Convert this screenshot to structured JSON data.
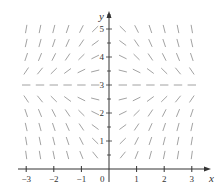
{
  "diagram": {
    "type": "slope_field",
    "axis_labels": {
      "x": "x",
      "y": "y"
    },
    "origin_label": "0",
    "x_ticks": [
      {
        "value": -3,
        "label": "−3"
      },
      {
        "value": -2,
        "label": "−2"
      },
      {
        "value": -1,
        "label": "−1"
      },
      {
        "value": 1,
        "label": "1"
      },
      {
        "value": 2,
        "label": "2"
      },
      {
        "value": 3,
        "label": "3"
      }
    ],
    "y_ticks": [
      {
        "value": 1,
        "label": "1"
      },
      {
        "value": 2,
        "label": "2"
      },
      {
        "value": 3,
        "label": "3"
      },
      {
        "value": 4,
        "label": "4"
      },
      {
        "value": 5,
        "label": "5"
      }
    ],
    "grid": {
      "x_min": -3,
      "x_max": 3,
      "y_min": 0.5,
      "y_max": 5,
      "step": 0.5
    },
    "equilibrium_y": 3,
    "slope_rule": "dy/dx = x(3 - y)",
    "colors": {
      "axis": "#333333",
      "segment": "#8a8a8a",
      "text": "#333333"
    }
  }
}
